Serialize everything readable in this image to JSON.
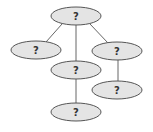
{
  "diagram": {
    "type": "tree",
    "colors": {
      "node_fill": "#e4e4e4",
      "node_stroke": "#555555",
      "edge": "#666666",
      "text": "#333333"
    },
    "nodes": [
      {
        "id": "root",
        "label": "?",
        "cx": 76,
        "cy": 16
      },
      {
        "id": "left",
        "label": "?",
        "cx": 36,
        "cy": 50
      },
      {
        "id": "right",
        "label": "?",
        "cx": 117,
        "cy": 51
      },
      {
        "id": "middle",
        "label": "?",
        "cx": 76,
        "cy": 70
      },
      {
        "id": "right-child",
        "label": "?",
        "cx": 117,
        "cy": 90
      },
      {
        "id": "bottom",
        "label": "?",
        "cx": 76,
        "cy": 112
      }
    ],
    "edges": [
      {
        "from": "root",
        "to": "left"
      },
      {
        "from": "root",
        "to": "middle"
      },
      {
        "from": "root",
        "to": "right"
      },
      {
        "from": "right",
        "to": "right-child"
      },
      {
        "from": "middle",
        "to": "bottom"
      }
    ]
  }
}
